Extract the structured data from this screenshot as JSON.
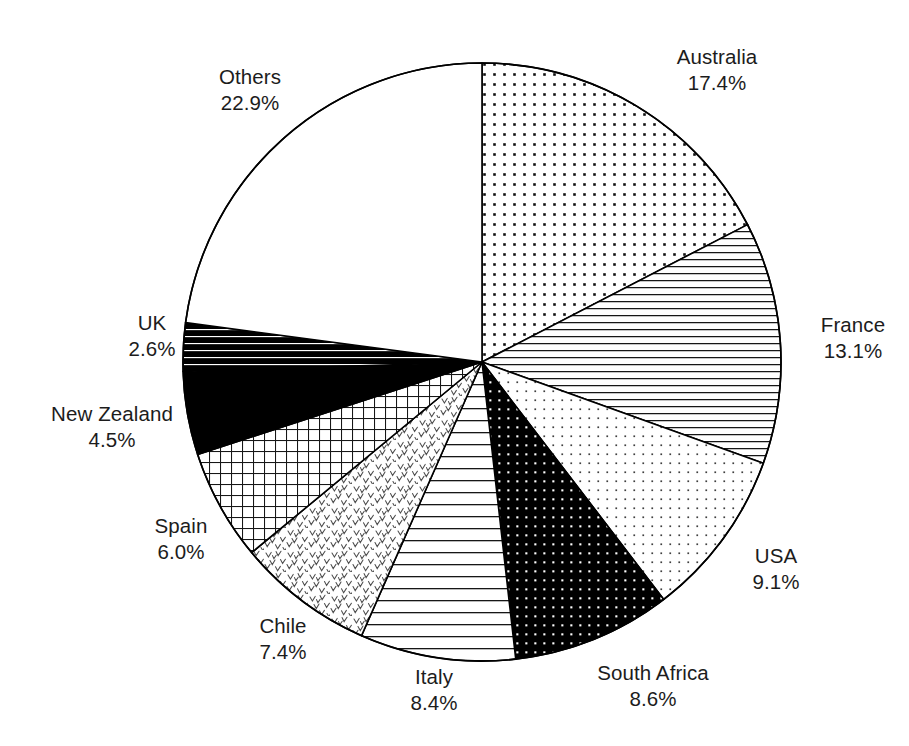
{
  "chart_data": {
    "type": "pie",
    "title": "",
    "subtitle": "",
    "xlabel": "",
    "ylabel": "",
    "legend_position": "outside-labels",
    "grid": false,
    "units": "percent",
    "start_angle_deg": 0,
    "direction": "clockwise",
    "categories": [
      "Australia",
      "France",
      "USA",
      "South Africa",
      "Italy",
      "Chile",
      "Spain",
      "New Zealand",
      "UK",
      "Others"
    ],
    "values": [
      17.4,
      13.1,
      9.1,
      8.6,
      8.4,
      7.4,
      6.0,
      4.5,
      2.6,
      22.9
    ],
    "slices": [
      {
        "label": "Australia",
        "value": 17.4,
        "value_text": "17.4%",
        "pattern": "dots-medium-black",
        "fill": "#ffffff",
        "ink": "#000000",
        "label_x": 717,
        "label_y": 44
      },
      {
        "label": "France",
        "value": 13.1,
        "value_text": "13.1%",
        "pattern": "horizontal-lines-medium",
        "fill": "#ffffff",
        "ink": "#000000",
        "label_x": 853,
        "label_y": 312
      },
      {
        "label": "USA",
        "value": 9.1,
        "value_text": "9.1%",
        "pattern": "dots-fine-grey",
        "fill": "#ffffff",
        "ink": "#3a3a3a",
        "label_x": 776,
        "label_y": 543
      },
      {
        "label": "South Africa",
        "value": 8.6,
        "value_text": "8.6%",
        "pattern": "black-with-white-dots",
        "fill": "#000000",
        "ink": "#ffffff",
        "label_x": 653,
        "label_y": 660
      },
      {
        "label": "Italy",
        "value": 8.4,
        "value_text": "8.4%",
        "pattern": "horizontal-lines-wide",
        "fill": "#ffffff",
        "ink": "#000000",
        "label_x": 434,
        "label_y": 664
      },
      {
        "label": "Chile",
        "value": 7.4,
        "value_text": "7.4%",
        "pattern": "chevron-scatter",
        "fill": "#ffffff",
        "ink": "#555555",
        "label_x": 283,
        "label_y": 613
      },
      {
        "label": "Spain",
        "value": 6.0,
        "value_text": "6.0%",
        "pattern": "grid-crosshatch",
        "fill": "#ffffff",
        "ink": "#000000",
        "label_x": 181,
        "label_y": 513
      },
      {
        "label": "New Zealand",
        "value": 4.5,
        "value_text": "4.5%",
        "pattern": "solid-black",
        "fill": "#000000",
        "ink": "#000000",
        "label_x": 112,
        "label_y": 401
      },
      {
        "label": "UK",
        "value": 2.6,
        "value_text": "2.6%",
        "pattern": "dense-black-horizontal-bars",
        "fill": "#000000",
        "ink": "#ffffff",
        "label_x": 152,
        "label_y": 310
      },
      {
        "label": "Others",
        "value": 22.9,
        "value_text": "22.9%",
        "pattern": "none-white",
        "fill": "#ffffff",
        "ink": "#000000",
        "label_x": 250,
        "label_y": 64
      }
    ],
    "geometry": {
      "center_x": 482,
      "center_y": 362,
      "radius": 299,
      "stroke": "#000000",
      "stroke_width": 1.6
    }
  }
}
